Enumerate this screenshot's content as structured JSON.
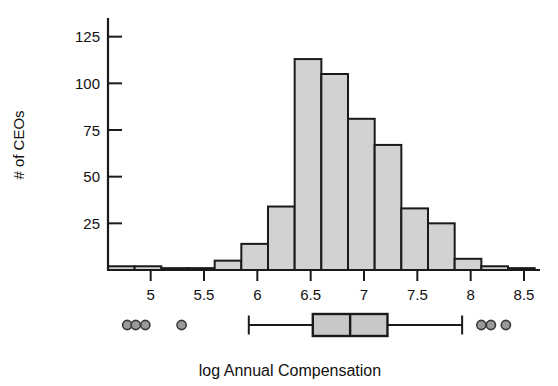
{
  "chart_data": {
    "type": "bar",
    "title": "",
    "xlabel": "log Annual Compensation",
    "ylabel": "# of CEOs",
    "bin_width": 0.25,
    "grid": false,
    "legend": "none",
    "xlim": [
      4.6,
      8.65
    ],
    "ylim": [
      0,
      135
    ],
    "xticks": [
      5,
      5.5,
      6,
      6.5,
      7,
      7.5,
      8,
      8.5
    ],
    "xtick_labels": [
      "5",
      "5.5",
      "6",
      "6.5",
      "7",
      "7.5",
      "8",
      "8.5"
    ],
    "yticks": [
      25,
      50,
      75,
      100,
      125
    ],
    "ytick_labels": [
      "25",
      "50",
      "75",
      "100",
      "125"
    ],
    "bin_edges": [
      4.6,
      4.85,
      5.1,
      5.35,
      5.6,
      5.85,
      6.1,
      6.35,
      6.6,
      6.85,
      7.1,
      7.35,
      7.6,
      7.85,
      8.1,
      8.35,
      8.6
    ],
    "categories": [
      "4.60-4.85",
      "4.85-5.10",
      "5.10-5.35",
      "5.35-5.60",
      "5.60-5.85",
      "5.85-6.10",
      "6.10-6.35",
      "6.35-6.60",
      "6.60-6.85",
      "6.85-7.10",
      "7.10-7.35",
      "7.35-7.60",
      "7.60-7.85",
      "7.85-8.10",
      "8.10-8.35",
      "8.35-8.60"
    ],
    "values": [
      2,
      2,
      1,
      1,
      5,
      14,
      34,
      113,
      105,
      81,
      67,
      33,
      25,
      6,
      2,
      1
    ],
    "bar_fill": "#d2d2d2",
    "bar_edge": "#1a1a1a"
  },
  "boxplot_data": {
    "type": "boxplot",
    "orientation": "horizontal",
    "whisker_low": 5.92,
    "q1": 6.52,
    "median": 6.87,
    "q3": 7.22,
    "whisker_high": 7.92,
    "outliers_low": [
      4.78,
      4.86,
      4.95,
      5.29
    ],
    "outliers_high": [
      8.1,
      8.19,
      8.33
    ],
    "box_fill": "#c8c8c8",
    "box_edge": "#1a1a1a",
    "outlier_fill": "#9a9a9a",
    "outlier_edge": "#3a3a3a"
  },
  "labels": {
    "y_axis_title": "# of CEOs",
    "x_axis_title": "log Annual Compensation"
  }
}
